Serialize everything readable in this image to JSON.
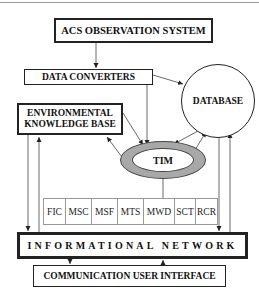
{
  "diagram": {
    "nodes": {
      "acs": "ACS OBSERVATION SYSTEM",
      "data_converters": "DATA CONVERTERS",
      "database": "DATABASE",
      "ekb_line1": "ENVIRONMENTAL",
      "ekb_line2": "KNOWLEDGE BASE",
      "tim": "TIM",
      "network": "INFORMATIONAL NETWORK",
      "cui": "COMMUNICATION USER INTERFACE"
    },
    "modules": [
      "FIC",
      "MSC",
      "MSF",
      "MTS",
      "MWD",
      "SCT",
      "RCR"
    ],
    "edges": [
      {
        "from": "ACS OBSERVATION SYSTEM",
        "to": "DATA CONVERTERS"
      },
      {
        "from": "DATA CONVERTERS",
        "to": "DATABASE"
      },
      {
        "from": "DATA CONVERTERS",
        "to": "TIM"
      },
      {
        "from": "ENVIRONMENTAL KNOWLEDGE BASE",
        "to": "TIM"
      },
      {
        "from": "TIM",
        "to": "ENVIRONMENTAL KNOWLEDGE BASE"
      },
      {
        "from": "DATABASE",
        "to": "TIM"
      },
      {
        "from": "TIM",
        "to": "DATABASE"
      },
      {
        "from": "TIM",
        "to": "modules"
      },
      {
        "from": "ENVIRONMENTAL KNOWLEDGE BASE",
        "to": "INFORMATIONAL NETWORK"
      },
      {
        "from": "INFORMATIONAL NETWORK",
        "to": "ENVIRONMENTAL KNOWLEDGE BASE"
      },
      {
        "from": "DATABASE",
        "to": "INFORMATIONAL NETWORK"
      },
      {
        "from": "INFORMATIONAL NETWORK",
        "to": "DATABASE"
      },
      {
        "from": "INFORMATIONAL NETWORK",
        "to": "COMMUNICATION USER INTERFACE"
      },
      {
        "from": "COMMUNICATION USER INTERFACE",
        "to": "INFORMATIONAL NETWORK"
      }
    ]
  }
}
